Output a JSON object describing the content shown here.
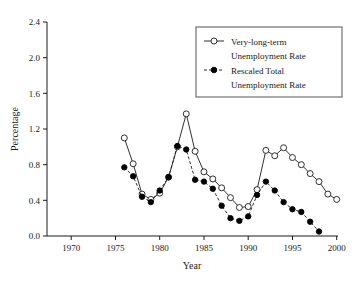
{
  "chart_data": {
    "type": "line",
    "title": "",
    "xlabel": "Year",
    "ylabel": "Percentage",
    "xlim": [
      1970,
      2000
    ],
    "ylim": [
      0.0,
      2.4
    ],
    "xticks": [
      1970,
      1975,
      1980,
      1985,
      1990,
      1995,
      2000
    ],
    "xticklabels": [
      "1970",
      "1975",
      "1980",
      "1985",
      "1990",
      "1995",
      "2000"
    ],
    "yticks": [
      0.0,
      0.4,
      0.8,
      1.2,
      1.6,
      2.0,
      2.4
    ],
    "yticklabels": [
      "0.0",
      "0.4",
      "0.8",
      "1.2",
      "1.6",
      "2.0",
      "2.4"
    ],
    "grid": false,
    "legend_position": "upper right",
    "series": [
      {
        "name": "Very-long-term Unemployment Rate",
        "marker": "open-circle",
        "linestyle": "solid",
        "color": "#1a1a1a",
        "x": [
          1976,
          1977,
          1978,
          1979,
          1980,
          1981,
          1982,
          1983,
          1984,
          1985,
          1986,
          1987,
          1988,
          1989,
          1990,
          1991,
          1992,
          1993,
          1994,
          1995,
          1996,
          1997,
          1998,
          1999,
          2000
        ],
        "y": [
          1.1,
          0.81,
          0.47,
          0.41,
          0.48,
          0.66,
          1.0,
          1.37,
          0.95,
          0.72,
          0.64,
          0.54,
          0.43,
          0.32,
          0.33,
          0.52,
          0.96,
          0.9,
          0.99,
          0.88,
          0.8,
          0.7,
          0.61,
          0.47,
          0.41
        ]
      },
      {
        "name": "Rescaled Total Unemployment Rate",
        "marker": "filled-circle",
        "linestyle": "dashed",
        "color": "#000000",
        "x": [
          1976,
          1977,
          1978,
          1979,
          1980,
          1981,
          1982,
          1983,
          1984,
          1985,
          1986,
          1987,
          1988,
          1989,
          1990,
          1991,
          1992,
          1993,
          1994,
          1995,
          1996,
          1997,
          1998
        ],
        "y": [
          0.77,
          0.67,
          0.44,
          0.38,
          0.51,
          0.66,
          1.01,
          0.97,
          0.63,
          0.61,
          0.53,
          0.34,
          0.2,
          0.17,
          0.22,
          0.46,
          0.61,
          0.51,
          0.38,
          0.3,
          0.27,
          0.16,
          0.05
        ]
      }
    ]
  },
  "legend": {
    "entries": [
      {
        "line1": "Very-long-term",
        "line2": "Unemployment Rate",
        "marker": "open-circle"
      },
      {
        "line1": "Rescaled Total",
        "line2": "Unemployment Rate",
        "marker": "filled-circle"
      }
    ]
  }
}
